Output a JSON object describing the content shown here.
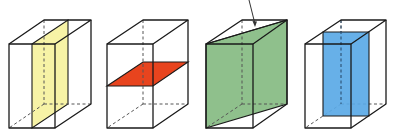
{
  "diagram": {
    "title": "",
    "figures": [
      {
        "id": "box-1",
        "section": "vertical plane parallel to side faces",
        "fill": "#f7f3a6"
      },
      {
        "id": "box-2",
        "section": "horizontal plane parallel to base",
        "fill": "#e8441e"
      },
      {
        "id": "box-3",
        "section": "diagonal plane through opposite edges",
        "fill": "#8fc08c"
      },
      {
        "id": "box-4",
        "section": "vertical plane parallel to front face",
        "fill": "#5aa9e6"
      }
    ],
    "arrow": {
      "pointing_to": "diagonal plane",
      "color": "#333333"
    }
  }
}
